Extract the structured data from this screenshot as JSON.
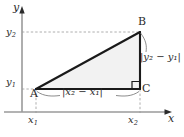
{
  "figure": {
    "type": "geometry-diagram",
    "background_color": "#ffffff",
    "axes": {
      "x_axis_label": "x",
      "y_axis_label": "y",
      "axis_color": "#8c8c8c",
      "arrow_color": "#2b2b2b",
      "x_ticks": [
        "x₁",
        "x₂"
      ],
      "y_ticks": [
        "y₁",
        "y₂"
      ]
    },
    "tick_labels": {
      "x1": {
        "base": "x",
        "sub": "1"
      },
      "x2": {
        "base": "x",
        "sub": "2"
      },
      "y1": {
        "base": "y",
        "sub": "1"
      },
      "y2": {
        "base": "y",
        "sub": "2"
      }
    },
    "vertices": [
      {
        "name": "A",
        "label": "A",
        "x": 1,
        "y": 1,
        "position": "lower-left"
      },
      {
        "name": "B",
        "label": "B",
        "x": 2,
        "y": 2,
        "position": "upper-right"
      },
      {
        "name": "C",
        "label": "C",
        "x": 2,
        "y": 1,
        "position": "lower-right"
      }
    ],
    "right_angle_at": "C",
    "measurements": {
      "horizontal_leg": "|x₂ − x₁|",
      "vertical_leg": "|y₂ − y₁|"
    },
    "triangle": {
      "fill_color": "#f2f2f2",
      "stroke_color": "#1a1a1a"
    },
    "guides": {
      "style": "dashed",
      "color": "#9a9a9a",
      "lines": [
        "y₂ horizontal to B",
        "y₁ horizontal to C",
        "x₁ vertical to A",
        "x₂ vertical to C"
      ]
    }
  }
}
